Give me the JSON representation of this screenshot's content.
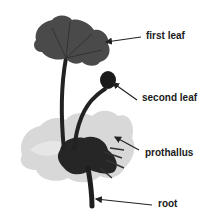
{
  "figure": {
    "colors": {
      "background": "#ffffff",
      "plant_dark": "#1e1e1e",
      "leaf_mid": "#4a4a4a",
      "prothallus": "#cfcfcf",
      "arrow": "#222222",
      "label": "#1a1a1a"
    }
  },
  "labels": [
    {
      "id": "first-leaf",
      "text": "first leaf",
      "x": 146,
      "y": 31,
      "arrow": {
        "x1": 141,
        "y1": 37,
        "x2": 106,
        "y2": 42
      }
    },
    {
      "id": "second-leaf",
      "text": "second leaf",
      "x": 142,
      "y": 93,
      "arrow": {
        "x1": 137,
        "y1": 100,
        "x2": 113,
        "y2": 83
      }
    },
    {
      "id": "prothallus",
      "text": "prothallus",
      "x": 145,
      "y": 148,
      "arrow": {
        "x1": 139,
        "y1": 150,
        "x2": 115,
        "y2": 137
      }
    },
    {
      "id": "root",
      "text": "root",
      "x": 158,
      "y": 199,
      "arrow": {
        "x1": 152,
        "y1": 205,
        "x2": 96,
        "y2": 199
      }
    }
  ]
}
